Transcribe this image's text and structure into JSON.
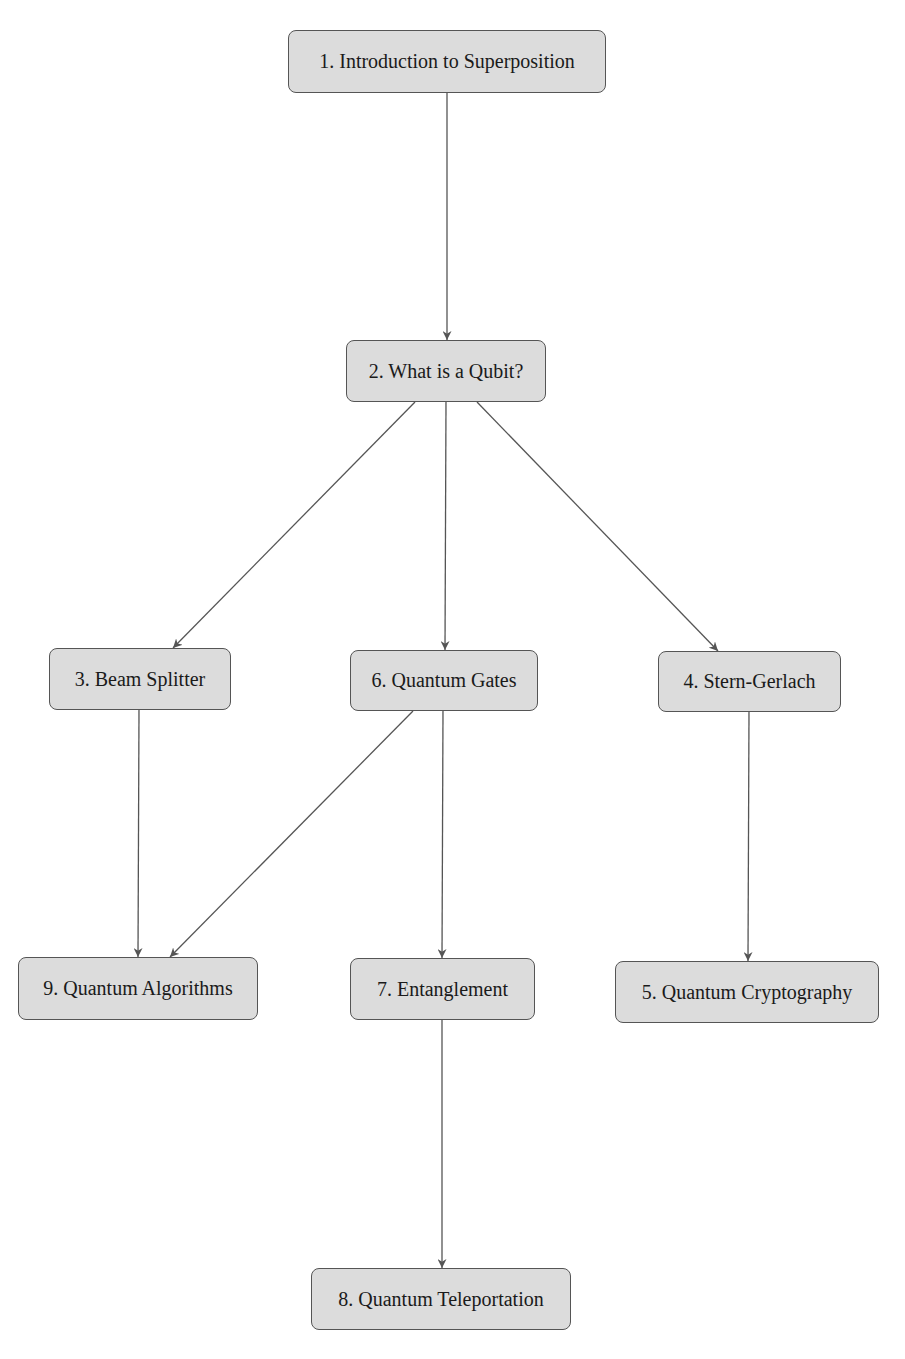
{
  "diagram": {
    "type": "flowchart",
    "colors": {
      "node_fill": "#dcdcdc",
      "node_border": "#555555",
      "edge": "#555555",
      "text": "#1a1a1a",
      "background": "#ffffff"
    },
    "nodes": [
      {
        "id": "n1",
        "label": "1. Introduction to Superposition",
        "x": 288,
        "y": 30,
        "w": 318,
        "h": 63
      },
      {
        "id": "n2",
        "label": "2. What is a Qubit?",
        "x": 346,
        "y": 340,
        "w": 200,
        "h": 62
      },
      {
        "id": "n3",
        "label": "3. Beam Splitter",
        "x": 49,
        "y": 648,
        "w": 182,
        "h": 62
      },
      {
        "id": "n6",
        "label": "6. Quantum Gates",
        "x": 350,
        "y": 650,
        "w": 188,
        "h": 61
      },
      {
        "id": "n4",
        "label": "4. Stern-Gerlach",
        "x": 658,
        "y": 651,
        "w": 183,
        "h": 61
      },
      {
        "id": "n9",
        "label": "9. Quantum Algorithms",
        "x": 18,
        "y": 957,
        "w": 240,
        "h": 63
      },
      {
        "id": "n7",
        "label": "7. Entanglement",
        "x": 350,
        "y": 958,
        "w": 185,
        "h": 62
      },
      {
        "id": "n5",
        "label": "5. Quantum Cryptography",
        "x": 615,
        "y": 961,
        "w": 264,
        "h": 62
      },
      {
        "id": "n8",
        "label": "8. Quantum Teleportation",
        "x": 311,
        "y": 1268,
        "w": 260,
        "h": 62
      }
    ],
    "edges": [
      {
        "from": "n1",
        "to": "n2",
        "x1": 447,
        "y1": 93,
        "x2": 447,
        "y2": 340
      },
      {
        "from": "n2",
        "to": "n3",
        "x1": 415,
        "y1": 402,
        "x2": 173,
        "y2": 648
      },
      {
        "from": "n2",
        "to": "n6",
        "x1": 446,
        "y1": 402,
        "x2": 445,
        "y2": 650
      },
      {
        "from": "n2",
        "to": "n4",
        "x1": 477,
        "y1": 402,
        "x2": 718,
        "y2": 651
      },
      {
        "from": "n3",
        "to": "n9",
        "x1": 139,
        "y1": 710,
        "x2": 138,
        "y2": 957
      },
      {
        "from": "n6",
        "to": "n9",
        "x1": 413,
        "y1": 711,
        "x2": 170,
        "y2": 957
      },
      {
        "from": "n6",
        "to": "n7",
        "x1": 443,
        "y1": 711,
        "x2": 442,
        "y2": 958
      },
      {
        "from": "n4",
        "to": "n5",
        "x1": 749,
        "y1": 712,
        "x2": 748,
        "y2": 961
      },
      {
        "from": "n7",
        "to": "n8",
        "x1": 442,
        "y1": 1020,
        "x2": 442,
        "y2": 1268
      }
    ]
  }
}
